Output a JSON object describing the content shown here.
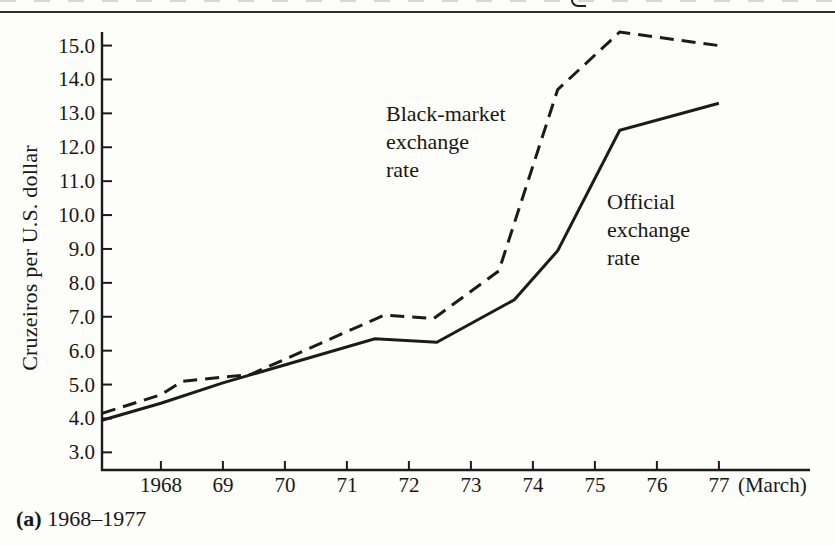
{
  "page": {
    "caption_prefix": "(a)",
    "caption_text": " 1968–1977"
  },
  "chart_data": {
    "type": "line",
    "title": "",
    "ylabel": "Cruzeiros per U.S. dollar",
    "xlabel": "",
    "x_axis_note": "(March)",
    "x_tick_labels": [
      "1968",
      "69",
      "70",
      "71",
      "72",
      "73",
      "74",
      "75",
      "76",
      "77"
    ],
    "x_tick_years": [
      1968,
      1969,
      1970,
      1971,
      1972,
      1973,
      1974,
      1975,
      1976,
      1977
    ],
    "y_tick_labels": [
      "15.0",
      "14.0",
      "13.0",
      "12.0",
      "11.0",
      "10.0",
      "9.0",
      "8.0",
      "7.0",
      "6.0",
      "5.0",
      "4.0",
      "3.0"
    ],
    "y_tick_values": [
      15,
      14,
      13,
      12,
      11,
      10,
      9,
      8,
      7,
      6,
      5,
      4,
      3
    ],
    "xlim": [
      1967.05,
      1978.5
    ],
    "ylim": [
      2.5,
      15.4
    ],
    "grid": false,
    "legend": "inline-annotations",
    "series": [
      {
        "name": "Black-market exchange rate",
        "line_style": "dashed",
        "label": "Black-market\nexchange\nrate",
        "points": [
          [
            1967.05,
            4.15
          ],
          [
            1968,
            4.7
          ],
          [
            1968.35,
            5.1
          ],
          [
            1969.45,
            5.3
          ],
          [
            1971.6,
            7.05
          ],
          [
            1972.4,
            6.95
          ],
          [
            1973.45,
            8.35
          ],
          [
            1974.4,
            13.7
          ],
          [
            1975.4,
            15.4
          ],
          [
            1977,
            15.0
          ]
        ]
      },
      {
        "name": "Official exchange rate",
        "line_style": "solid",
        "label": "Official\nexchange\nrate",
        "points": [
          [
            1967.05,
            3.95
          ],
          [
            1968,
            4.45
          ],
          [
            1969,
            5.05
          ],
          [
            1971.45,
            6.35
          ],
          [
            1972.45,
            6.25
          ],
          [
            1973.7,
            7.5
          ],
          [
            1974.4,
            8.95
          ],
          [
            1975.4,
            12.5
          ],
          [
            1977,
            13.3
          ]
        ]
      }
    ],
    "colors": {
      "line": "#1b1b1b",
      "axis": "#1b1b1b",
      "text": "#171717",
      "rule": "#2e2e2e"
    }
  }
}
